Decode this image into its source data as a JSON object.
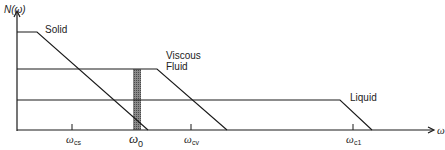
{
  "diagram": {
    "y_axis_label": "N(ω)",
    "x_axis_label": "ω",
    "curves": [
      {
        "name": "solid",
        "label": "Solid"
      },
      {
        "name": "viscous-fluid",
        "label_line1": "Viscous",
        "label_line2": "Fluid"
      },
      {
        "name": "liquid",
        "label": "Liquid"
      }
    ],
    "ticks": [
      {
        "name": "omega-cs",
        "symbol": "ω",
        "subscript": "cs"
      },
      {
        "name": "omega-0",
        "symbol": "ω",
        "subscript": "0"
      },
      {
        "name": "omega-cv",
        "symbol": "ω",
        "subscript": "cv"
      },
      {
        "name": "omega-c1",
        "symbol": "ω",
        "subscript": "c1"
      }
    ],
    "colors": {
      "line": "#1a1a1a",
      "hatch": "#6e6e6e"
    }
  }
}
